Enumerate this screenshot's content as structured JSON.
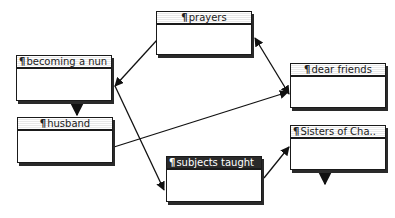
{
  "diagram": {
    "type": "hypertext-storyspace-map",
    "nodes": [
      {
        "id": "prayers",
        "icon": "¶",
        "label": "prayers",
        "selected": false
      },
      {
        "id": "becoming-a-nun",
        "icon": "¶",
        "label": "becoming a nun",
        "selected": false
      },
      {
        "id": "dear-friends",
        "icon": "¶",
        "label": "dear friends",
        "selected": false
      },
      {
        "id": "husband",
        "icon": "¶",
        "label": "husband",
        "selected": false
      },
      {
        "id": "sisters-of-charity",
        "icon": "¶",
        "label": "Sisters of Cha..",
        "selected": false
      },
      {
        "id": "subjects-taught",
        "icon": "¶",
        "label": "subjects taught",
        "selected": true
      }
    ],
    "links": [
      {
        "from": "prayers",
        "to": "becoming-a-nun",
        "arrow": "end"
      },
      {
        "from": "becoming-a-nun",
        "to": "subjects-taught",
        "arrow": "end"
      },
      {
        "from": "becoming-a-nun",
        "to": "husband",
        "arrow": "end"
      },
      {
        "from": "husband",
        "to": "dear-friends",
        "arrow": "end"
      },
      {
        "from": "prayers",
        "to": "dear-friends",
        "arrow": "both"
      },
      {
        "from": "subjects-taught",
        "to": "sisters-of-charity",
        "arrow": "end"
      },
      {
        "from": "sisters-of-charity",
        "to": "offscreen-below",
        "arrow": "end"
      }
    ],
    "colors": {
      "ink": "#1a1a1a",
      "background": "#ffffff",
      "selected_title": "#2a2a2a"
    }
  }
}
